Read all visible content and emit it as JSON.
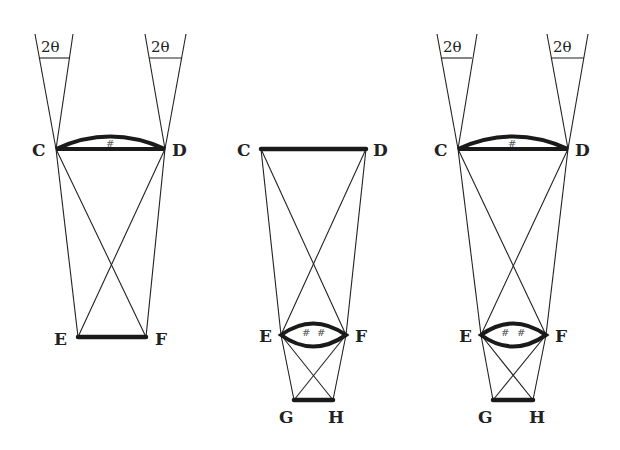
{
  "figure": {
    "panels": [
      {
        "id": "panel-1",
        "points": {
          "C": "C",
          "D": "D",
          "E": "E",
          "F": "F"
        },
        "angle_labels": [
          "2θ",
          "2θ"
        ],
        "lens_at": "CD"
      },
      {
        "id": "panel-2",
        "points": {
          "C": "C",
          "D": "D",
          "E": "E",
          "F": "F",
          "G": "G",
          "H": "H"
        },
        "angle_labels": [],
        "lens_at": "EF"
      },
      {
        "id": "panel-3",
        "points": {
          "C": "C",
          "D": "D",
          "E": "E",
          "F": "F",
          "G": "G",
          "H": "H"
        },
        "angle_labels": [
          "2θ",
          "2θ"
        ],
        "lens_at": "CD and EF"
      }
    ],
    "hatch_mark": "#"
  }
}
